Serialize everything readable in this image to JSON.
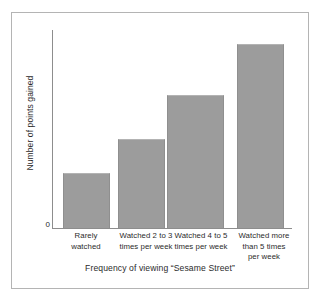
{
  "chart_data": {
    "type": "bar",
    "title": "",
    "subtitle": "",
    "xlabel": "Frequency of viewing “Sesame Street”",
    "ylabel": "Number of points gained",
    "categories": [
      "Rarely watched",
      "Watched 2 to 3 times per week",
      "Watched 4 to 5 times per week",
      "Watched more than 5 times per week"
    ],
    "category_lines": [
      [
        "Rarely",
        "watched"
      ],
      [
        "Watched 2 to 3",
        "times per week"
      ],
      [
        "Watched 4 to 5",
        "times per week"
      ],
      [
        "Watched more",
        "than 5 times",
        "per week"
      ]
    ],
    "values": [
      28,
      45,
      67,
      93
    ],
    "ylim": [
      0,
      100
    ],
    "xlim": null,
    "ytick_labels": [
      "0"
    ],
    "yticks": [
      0
    ],
    "grid": false,
    "legend": null,
    "legend_position": "none",
    "bar_color": "#9c9c9c",
    "axis_color": "#8d8d8d",
    "text_color": "#2b2b2b",
    "background_color": "#ffffff",
    "frame_color": "#b4b4b4",
    "annotations": []
  },
  "axes": {
    "y_zero_label": "0",
    "y_axis_title": "Number of points gained",
    "x_axis_title": "Frequency of viewing “Sesame Street”"
  },
  "bars": [
    {
      "label_line1": "Rarely",
      "label_line2": "watched",
      "label_line3": "",
      "value": 28
    },
    {
      "label_line1": "Watched 2 to 3",
      "label_line2": "times per week",
      "label_line3": "",
      "value": 45
    },
    {
      "label_line1": "Watched 4 to 5",
      "label_line2": "times per week",
      "label_line3": "",
      "value": 67
    },
    {
      "label_line1": "Watched more",
      "label_line2": "than 5 times",
      "label_line3": "per week",
      "value": 93
    }
  ]
}
